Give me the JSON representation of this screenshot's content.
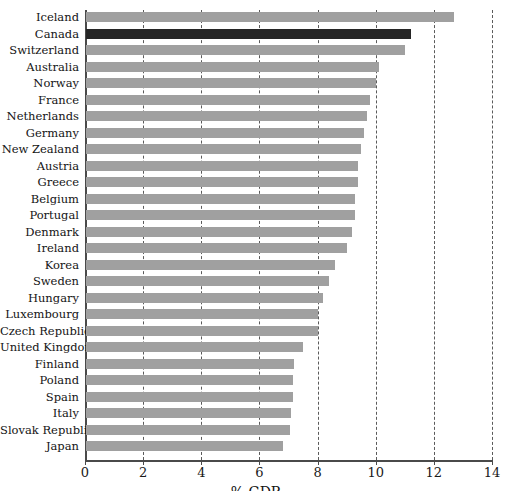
{
  "chart_data": {
    "type": "bar",
    "orientation": "horizontal",
    "title": "",
    "xlabel": "% GDP",
    "ylabel": "",
    "xlim": [
      0,
      14
    ],
    "xticks": [
      0,
      2,
      4,
      6,
      8,
      10,
      12,
      14
    ],
    "xtick_labels": [
      "0",
      "2",
      "4",
      "6",
      "8",
      "10",
      "12",
      "14"
    ],
    "grid": "vertical-dashed",
    "legend": "none",
    "bar_color": "#a0a0a0",
    "highlight_color": "#262626",
    "highlight_category": "Canada",
    "categories": [
      "Iceland",
      "Canada",
      "Switzerland",
      "Australia",
      "Norway",
      "France",
      "Netherlands",
      "Germany",
      "New Zealand",
      "Austria",
      "Greece",
      "Belgium",
      "Portugal",
      "Denmark",
      "Ireland",
      "Korea",
      "Sweden",
      "Hungary",
      "Luxembourg",
      "Czech Republic",
      "United Kingdom",
      "Finland",
      "Poland",
      "Spain",
      "Italy",
      "Slovak Republic",
      "Japan"
    ],
    "values": [
      12.7,
      11.2,
      11.0,
      10.1,
      10.0,
      9.8,
      9.7,
      9.6,
      9.5,
      9.4,
      9.4,
      9.3,
      9.3,
      9.2,
      9.0,
      8.6,
      8.4,
      8.2,
      8.0,
      8.0,
      7.5,
      7.2,
      7.15,
      7.15,
      7.1,
      7.05,
      6.8
    ]
  }
}
